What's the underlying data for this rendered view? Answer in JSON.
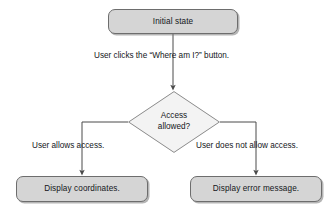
{
  "diagram": {
    "type": "flowchart",
    "colors": {
      "box_fill": "#d5d5d5",
      "box_stroke": "#6d6d6d",
      "diamond_fill": "#f3f3f3",
      "diamond_stroke": "#8a8a8a",
      "connector": "#4a4a4a",
      "text": "#14161a",
      "background": "#ffffff"
    },
    "nodes": [
      {
        "id": "initial-state",
        "shape": "rounded-rect",
        "label": "Initial state"
      },
      {
        "id": "access-allowed",
        "shape": "diamond",
        "label_line1": "Access",
        "label_line2": "allowed?"
      },
      {
        "id": "display-coordinates",
        "shape": "rounded-rect",
        "label": "Display coordinates."
      },
      {
        "id": "display-error",
        "shape": "rounded-rect",
        "label": "Display error message."
      }
    ],
    "edges": [
      {
        "id": "initial-to-decision",
        "from": "initial-state",
        "to": "access-allowed",
        "label": "User clicks the “Where am I?” button.",
        "arrow": true
      },
      {
        "id": "decision-to-coordinates",
        "from": "access-allowed",
        "to": "display-coordinates",
        "label": "User allows access.",
        "arrow": true
      },
      {
        "id": "decision-to-error",
        "from": "access-allowed",
        "to": "display-error",
        "label": "User does not allow access.",
        "arrow": true
      }
    ]
  }
}
